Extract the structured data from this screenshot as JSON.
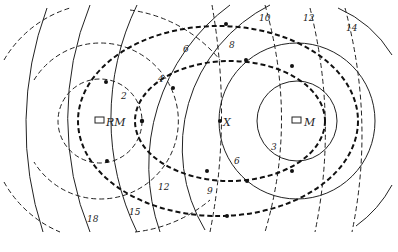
{
  "diagram": {
    "stations": [
      {
        "id": "RM",
        "label": "RM",
        "x": 100,
        "y": 121
      },
      {
        "id": "M",
        "label": "M",
        "x": 297,
        "y": 121
      },
      {
        "id": "X",
        "label": "X",
        "x": 220,
        "y": 121
      }
    ],
    "labels": {
      "l2": "2",
      "l4": "4",
      "l6a": "6",
      "l8": "8",
      "l10": "10",
      "l12a": "12",
      "l14": "14",
      "l3": "3",
      "l6b": "6",
      "l9": "9",
      "l12b": "12",
      "l15": "15",
      "l18": "18"
    }
  }
}
